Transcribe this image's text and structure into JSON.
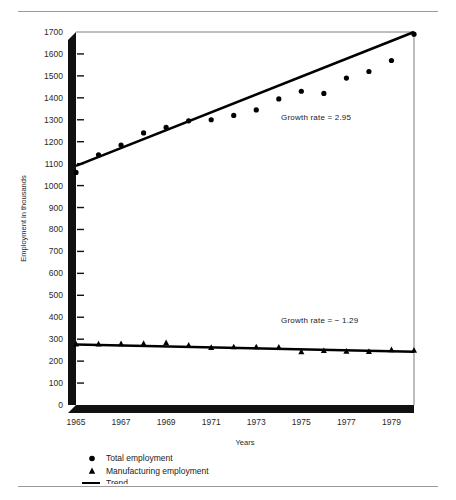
{
  "figure": {
    "rules": {
      "top": true,
      "bottom": true
    }
  },
  "chart_data": {
    "type": "scatter",
    "title": "",
    "xlabel": "Years",
    "ylabel": "Employment in thousands",
    "xlim": [
      1965,
      1980
    ],
    "ylim": [
      0,
      1700
    ],
    "ytick_step": 100,
    "yticks": [
      0,
      100,
      200,
      300,
      400,
      500,
      600,
      700,
      800,
      900,
      1000,
      1100,
      1200,
      1300,
      1400,
      1500,
      1600,
      1700
    ],
    "xticks": [
      1965,
      1967,
      1969,
      1971,
      1973,
      1975,
      1977,
      1979
    ],
    "xtick_labels": [
      "1965",
      "1967",
      "1969",
      "1971",
      "1973",
      "1975",
      "1977",
      "1979"
    ],
    "grid": false,
    "legend_position": "below-axis",
    "x": [
      1965,
      1966,
      1967,
      1968,
      1969,
      1970,
      1971,
      1972,
      1973,
      1974,
      1975,
      1976,
      1977,
      1978,
      1979,
      1980
    ],
    "series": [
      {
        "name": "Total employment",
        "marker": "circle",
        "values": [
          1060,
          1140,
          1185,
          1240,
          1265,
          1295,
          1300,
          1320,
          1345,
          1395,
          1430,
          1420,
          1490,
          1520,
          1570,
          1690
        ]
      },
      {
        "name": "Manufacturing employment",
        "marker": "triangle",
        "values": [
          278,
          278,
          279,
          280,
          284,
          272,
          262,
          265,
          265,
          264,
          243,
          248,
          245,
          244,
          252,
          250
        ]
      }
    ],
    "trend_lines": [
      {
        "for": "Total employment",
        "x0": 1965,
        "y0": 1090,
        "x1": 1980,
        "y1": 1700
      },
      {
        "for": "Manufacturing employment",
        "x0": 1965,
        "y0": 276,
        "x1": 1980,
        "y1": 243
      }
    ],
    "annotations": [
      {
        "text": "Growth rate = 2.95",
        "x": 1974.1,
        "y": 1300
      },
      {
        "text": "Growth rate = − 1.29",
        "x": 1974.1,
        "y": 375
      }
    ],
    "legend": [
      {
        "label": "Total employment",
        "marker": "circle"
      },
      {
        "label": "Manufacturing employment",
        "marker": "triangle"
      },
      {
        "label": "Trend",
        "marker": "line"
      }
    ]
  }
}
